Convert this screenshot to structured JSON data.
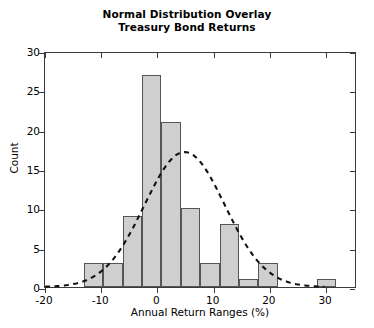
{
  "chart_data": {
    "type": "bar",
    "title": "Normal Distribution Overlay",
    "subtitle": "Treasury Bond Returns",
    "xlabel": "Annual Return Ranges (%)",
    "ylabel": "Count",
    "xlim": [
      -20,
      35.5
    ],
    "ylim": [
      0,
      30
    ],
    "xticks": [
      -20,
      -10,
      0,
      10,
      20,
      30
    ],
    "yticks": [
      0,
      5,
      10,
      15,
      20,
      25,
      30
    ],
    "grid": false,
    "legend": null,
    "bin_width": 3.45,
    "bin_edges": [
      -13.1,
      -9.65,
      -6.2,
      -2.75,
      0.7,
      4.15,
      7.6,
      11.05,
      14.5,
      17.95,
      21.4,
      24.85,
      28.3,
      31.75
    ],
    "categories": [
      "-13.1 to -9.7",
      "-9.7 to -6.2",
      "-6.2 to -2.8",
      "-2.8 to 0.7",
      "0.7 to 4.2",
      "4.2 to 7.6",
      "7.6 to 11.1",
      "11.1 to 14.5",
      "14.5 to 18.0",
      "18.0 to 21.4",
      "21.4 to 24.9",
      "24.9 to 28.3",
      "28.3 to 31.8"
    ],
    "values": [
      3,
      3,
      9,
      27,
      21,
      10,
      3,
      8,
      1,
      3,
      0,
      0,
      1
    ],
    "overlay": {
      "name": "normal-distribution-curve",
      "style": "dashed",
      "color": "#111111",
      "mean": 5.0,
      "sigma": 7.2,
      "peak": 17.3,
      "x_start": -20.0,
      "x_end": 30.0
    },
    "colors": {
      "bar_fill": "#cfcfcf",
      "bar_edge": "#555555",
      "axis": "#3a3a3a",
      "text": "#000000",
      "curve": "#111111",
      "background": "#ffffff"
    }
  }
}
